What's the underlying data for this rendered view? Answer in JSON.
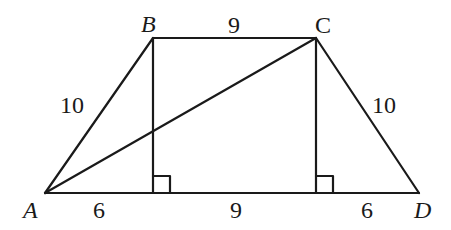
{
  "diagram": {
    "type": "trapezoid",
    "stroke_color": "#1a1a1a",
    "vertices": [
      {
        "name": "A",
        "x": 45,
        "y": 193,
        "italic": true
      },
      {
        "name": "B",
        "x": 153,
        "y": 38,
        "italic": true
      },
      {
        "name": "C",
        "x": 316,
        "y": 38,
        "italic": false
      },
      {
        "name": "D",
        "x": 419,
        "y": 193,
        "italic": true
      }
    ],
    "segments": [
      {
        "from": "A",
        "to": "B",
        "length": "10"
      },
      {
        "from": "B",
        "to": "C",
        "length": "9"
      },
      {
        "from": "C",
        "to": "D",
        "length": "10"
      },
      {
        "from": "A",
        "to": "D",
        "length": ""
      },
      {
        "from": "A",
        "to": "C",
        "length": "",
        "kind": "diagonal"
      },
      {
        "from": "B",
        "to": "foot_B",
        "length": "",
        "kind": "altitude"
      },
      {
        "from": "C",
        "to": "foot_C",
        "length": "",
        "kind": "altitude"
      }
    ],
    "base_segments": [
      "6",
      "9",
      "6"
    ],
    "right_angle_marks": 2
  },
  "labels": {
    "A": "A",
    "B": "B",
    "C": "C",
    "D": "D",
    "AB": "10",
    "BC": "9",
    "CD": "10",
    "base_left": "6",
    "base_mid": "9",
    "base_right": "6"
  }
}
